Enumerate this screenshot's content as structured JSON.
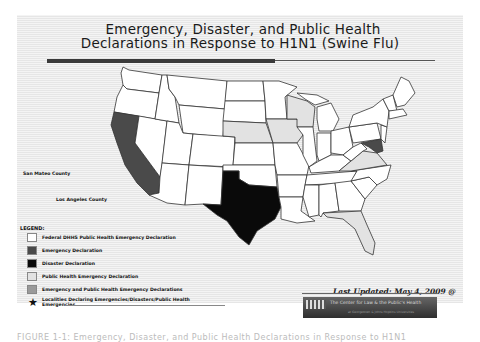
{
  "title": {
    "line1": "Emergency, Disaster, and Public Health",
    "line2": "Declarations in Response to H1N1 (Swine Flu)"
  },
  "colors": {
    "none": "#ffffff",
    "federal_dhhs": "#ffffff",
    "emergency": "#4a4a4a",
    "disaster": "#0a0a0a",
    "public_health_emergency": "#e2e2e2",
    "emergency_and_public_health": "#9a9a9a",
    "border": "#333333"
  },
  "map": {
    "county_labels": [
      {
        "name": "San Mateo County"
      },
      {
        "name": "Los Angeles County"
      }
    ],
    "states": {
      "emergency": [
        "California",
        "Maryland"
      ],
      "disaster": [
        "Texas"
      ],
      "public_health_emergency": [
        "Nebraska",
        "Iowa",
        "Wisconsin",
        "Virginia",
        "Florida"
      ]
    }
  },
  "legend": {
    "title": "LEGEND:",
    "items": [
      {
        "label": "Federal DHHS Public Health Emergency Declaration",
        "swatch": "#ffffff"
      },
      {
        "label": "Emergency Declaration",
        "swatch": "#4a4a4a"
      },
      {
        "label": "Disaster Declaration",
        "swatch": "#0a0a0a"
      },
      {
        "label": "Public Health Emergency Declaration",
        "swatch": "#e2e2e2"
      },
      {
        "label": "Emergency and Public Health Emergency Declarations",
        "swatch": "#9a9a9a"
      },
      {
        "label": "Localities Declaring Emergencies/Disasters/Public Health Emergencies",
        "icon": "star-icon"
      }
    ]
  },
  "updated": {
    "line1": "Last Updated: May 4, 2009 @",
    "line2": "12:00 p.m."
  },
  "banner": {
    "text": "The Center for Law & the Public's Health",
    "subtext": "at Georgetown & Johns Hopkins Universities"
  },
  "caption": "FIGURE 1-1: Emergency, Disaster, and Public Health Declarations in Response to H1N1"
}
